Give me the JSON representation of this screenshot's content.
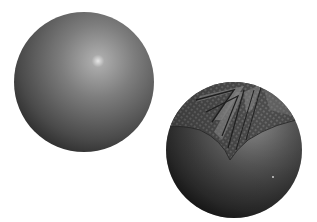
{
  "scene": {
    "description": "Two rendered gray spheres on a white background",
    "background": "#ffffff"
  },
  "spheres": [
    {
      "name": "plain-sphere",
      "cx": 84,
      "cy": 82,
      "r": 70,
      "base_color": "#6e6e6e",
      "highlight_color": "#d8d8d8",
      "shadow_color": "#262626",
      "highlight": {
        "cx": 96,
        "cy": 64
      }
    },
    {
      "name": "textured-sphere",
      "cx": 234,
      "cy": 150,
      "r": 68,
      "base_color": "#5a5a5a",
      "highlight_color": "#9a9a9a",
      "shadow_color": "#1e1e1e",
      "pattern": "woven chevron texture on upper cap",
      "pattern_color": "#2a2a2a",
      "pattern_light": "#8c8c8c"
    }
  ]
}
